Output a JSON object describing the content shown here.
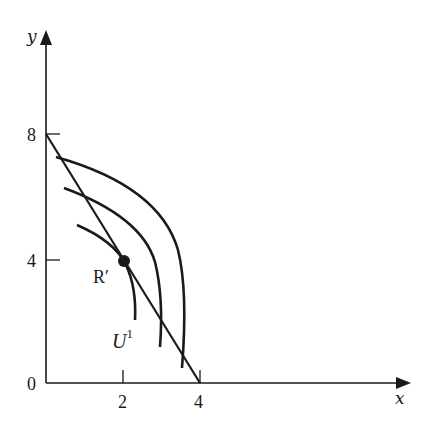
{
  "diagram": {
    "type": "indifference-curves-budget-line",
    "axes": {
      "x": {
        "label": "x",
        "ticks": [
          {
            "value": 0,
            "label": "0"
          },
          {
            "value": 2,
            "label": "2"
          },
          {
            "value": 4,
            "label": "4"
          }
        ]
      },
      "y": {
        "label": "y",
        "ticks": [
          {
            "value": 4,
            "label": "4"
          },
          {
            "value": 8,
            "label": "8"
          }
        ]
      }
    },
    "budget_line": {
      "y_intercept": 8,
      "x_intercept": 4
    },
    "point": {
      "label": "R′",
      "x": 2,
      "y": 4
    },
    "curves": [
      {
        "name": "inner",
        "label": "U",
        "superscript": "1"
      },
      {
        "name": "middle",
        "label": ""
      },
      {
        "name": "outer",
        "label": ""
      }
    ],
    "colors": {
      "ink": "#1a1a1a",
      "background": "#ffffff"
    }
  }
}
